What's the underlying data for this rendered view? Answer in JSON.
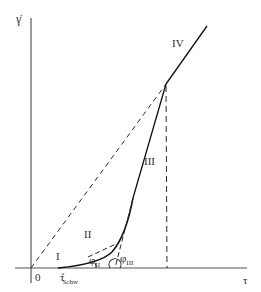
{
  "diagram": {
    "y_axis_label": "γ̇",
    "x_axis_label": "τ",
    "origin_label": "0",
    "regions": [
      "I",
      "II",
      "III",
      "IV"
    ],
    "angle_labels": {
      "phi_II_base": "φ",
      "phi_II_sub": "II",
      "phi_III_base": "φ",
      "phi_III_sub": "III"
    },
    "threshold_label": {
      "base": "τ",
      "sup": "*",
      "sub": "Schw"
    },
    "colors": {
      "line": "#2b2b2b",
      "background": "#ffffff"
    }
  }
}
